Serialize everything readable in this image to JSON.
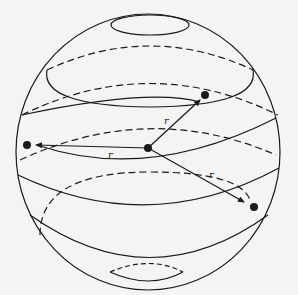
{
  "figure": {
    "labels": {
      "r_upper": "r",
      "r_left": "r",
      "r_lower": "r"
    },
    "colors": {
      "stroke": "#1a1a1a",
      "background": "#f4f4f2"
    }
  }
}
